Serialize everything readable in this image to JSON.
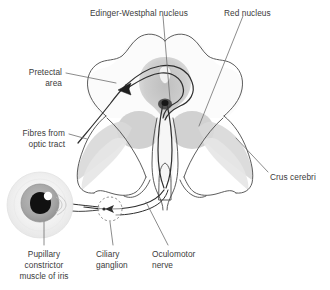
{
  "figure": {
    "background_color": "#ffffff"
  },
  "labels": {
    "edinger_westphal": "Edinger-Westphal nucleus",
    "red_nucleus": "Red nucleus",
    "pretectal_area_line1": "Pretectal",
    "pretectal_area_line2": "area",
    "fibres_optic_line1": "Fibres from",
    "fibres_optic_line2": "optic tract",
    "crus_cerebri": "Crus cerebri",
    "pupillary_line1": "Pupillary",
    "pupillary_line2": "constrictor",
    "pupillary_line3": "muscle of iris",
    "ciliary_line1": "Ciliary",
    "ciliary_line2": "ganglion",
    "oculomotor_line1": "Oculomotor",
    "oculomotor_line2": "nerve"
  },
  "colors": {
    "outline": "#4a4a4a",
    "nerve_fibre": "#2e2e2e",
    "leader_line": "#6e6e6e",
    "text": "#3b3b3b",
    "tectum_fill": "#fbfbfb",
    "periaqueductal_gray": "#bdbdbd",
    "red_nucleus_fill": "#c9c9c9",
    "substantia_nigra_fill": "#d6d6d6",
    "crus_fill": "#e2e2e2",
    "aqueduct_fill": "#efefef",
    "eye_globe": "#f0f0f0",
    "eye_iris": "#a8a8a8",
    "eye_pupil": "#111111",
    "eye_highlight": "#ffffff"
  },
  "structures": [
    {
      "name": "midbrain-cross-section",
      "type": "outline"
    },
    {
      "name": "tectum-superior-colliculi",
      "type": "lobed-outline"
    },
    {
      "name": "periaqueductal-gray",
      "type": "shaded-region"
    },
    {
      "name": "cerebral-aqueduct",
      "type": "shaded-region"
    },
    {
      "name": "red-nucleus-left",
      "type": "shaded-oval"
    },
    {
      "name": "red-nucleus-right",
      "type": "shaded-oval"
    },
    {
      "name": "substantia-nigra-left",
      "type": "shaded-band"
    },
    {
      "name": "substantia-nigra-right",
      "type": "shaded-band"
    },
    {
      "name": "crus-cerebri-left",
      "type": "shaded-band"
    },
    {
      "name": "crus-cerebri-right",
      "type": "shaded-band"
    },
    {
      "name": "interpeduncular-fossa",
      "type": "outline"
    },
    {
      "name": "eye-globe",
      "type": "circle"
    },
    {
      "name": "iris",
      "type": "circle"
    },
    {
      "name": "pupil",
      "type": "circle"
    },
    {
      "name": "ciliary-ganglion",
      "type": "dashed-circle"
    },
    {
      "name": "optic-tract-fibre",
      "type": "path"
    },
    {
      "name": "oculomotor-nerve-fibre",
      "type": "path"
    }
  ]
}
